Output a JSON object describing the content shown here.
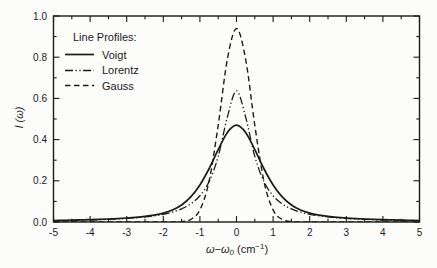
{
  "figure": {
    "background": "#fcfcfa",
    "line_color": "#1b1b1b"
  },
  "labels": {
    "x_main": "ω−ω",
    "x_sub": "0",
    "x_mid": " (cm",
    "x_sup": "−1",
    "x_end": ")",
    "y_main": "I",
    "y_rest": " (ω)"
  },
  "legend": {
    "title": "Line Profiles:",
    "items": [
      {
        "label": "Voigt",
        "style": "solid"
      },
      {
        "label": "Lorentz",
        "style": "dash-dot-dot"
      },
      {
        "label": "Gauss",
        "style": "dashed"
      }
    ]
  },
  "chart_data": {
    "type": "line",
    "title": "",
    "xlabel": "ω−ω0 (cm−1)",
    "ylabel": "I(ω)",
    "xlim": [
      -5,
      5
    ],
    "ylim": [
      0,
      1
    ],
    "xticks": [
      -5,
      -4,
      -3,
      -2,
      -1,
      0,
      1,
      2,
      3,
      4,
      5
    ],
    "yticks": [
      0.0,
      0.2,
      0.4,
      0.6,
      0.8,
      1.0
    ],
    "x_minor_step": 0.5,
    "y_minor_step": 0.1,
    "grid": false,
    "legend_position": "upper-left-inside",
    "line_color": "#1b1b1b",
    "x": [
      -5,
      -4.75,
      -4.5,
      -4.25,
      -4,
      -3.75,
      -3.5,
      -3.25,
      -3,
      -2.75,
      -2.5,
      -2.25,
      -2,
      -1.75,
      -1.5,
      -1.25,
      -1,
      -0.75,
      -0.5,
      -0.25,
      0,
      0.25,
      0.5,
      0.75,
      1,
      1.25,
      1.5,
      1.75,
      2,
      2.25,
      2.5,
      2.75,
      3,
      3.25,
      3.5,
      3.75,
      4,
      4.25,
      4.5,
      4.75,
      5
    ],
    "series": [
      {
        "name": "Voigt",
        "style": "solid",
        "peak": 0.47,
        "values": [
          0.0072,
          0.008,
          0.0089,
          0.01,
          0.0112,
          0.0127,
          0.0145,
          0.0166,
          0.0193,
          0.0227,
          0.0273,
          0.0336,
          0.043,
          0.0581,
          0.0826,
          0.1217,
          0.1799,
          0.2585,
          0.3508,
          0.4343,
          0.47,
          0.4343,
          0.3508,
          0.2585,
          0.1799,
          0.1217,
          0.0826,
          0.0581,
          0.043,
          0.0336,
          0.0273,
          0.0227,
          0.0193,
          0.0166,
          0.0145,
          0.0127,
          0.0112,
          0.01,
          0.0089,
          0.008,
          0.0072
        ]
      },
      {
        "name": "Lorentz",
        "style": "dash-dot-dot",
        "peak": 0.64,
        "values": [
          0.0063,
          0.007,
          0.0078,
          0.0087,
          0.0098,
          0.0111,
          0.0127,
          0.0147,
          0.0172,
          0.0204,
          0.0245,
          0.03,
          0.0374,
          0.048,
          0.0637,
          0.0878,
          0.1273,
          0.1959,
          0.3183,
          0.5093,
          0.6366,
          0.5093,
          0.3183,
          0.1959,
          0.1273,
          0.0878,
          0.0637,
          0.048,
          0.0374,
          0.03,
          0.0245,
          0.0204,
          0.0172,
          0.0147,
          0.0127,
          0.0111,
          0.0098,
          0.0087,
          0.0078,
          0.007,
          0.0063
        ]
      },
      {
        "name": "Gauss",
        "style": "dashed",
        "peak": 0.94,
        "values": [
          0,
          0,
          0,
          0,
          0,
          0,
          0,
          0,
          0,
          0,
          0,
          0,
          0,
          0.0002,
          0.0018,
          0.0123,
          0.0587,
          0.1975,
          0.4697,
          0.7899,
          0.9394,
          0.7899,
          0.4697,
          0.1975,
          0.0587,
          0.0123,
          0.0018,
          0.0002,
          0,
          0,
          0,
          0,
          0,
          0,
          0,
          0,
          0,
          0,
          0,
          0,
          0
        ]
      }
    ]
  }
}
